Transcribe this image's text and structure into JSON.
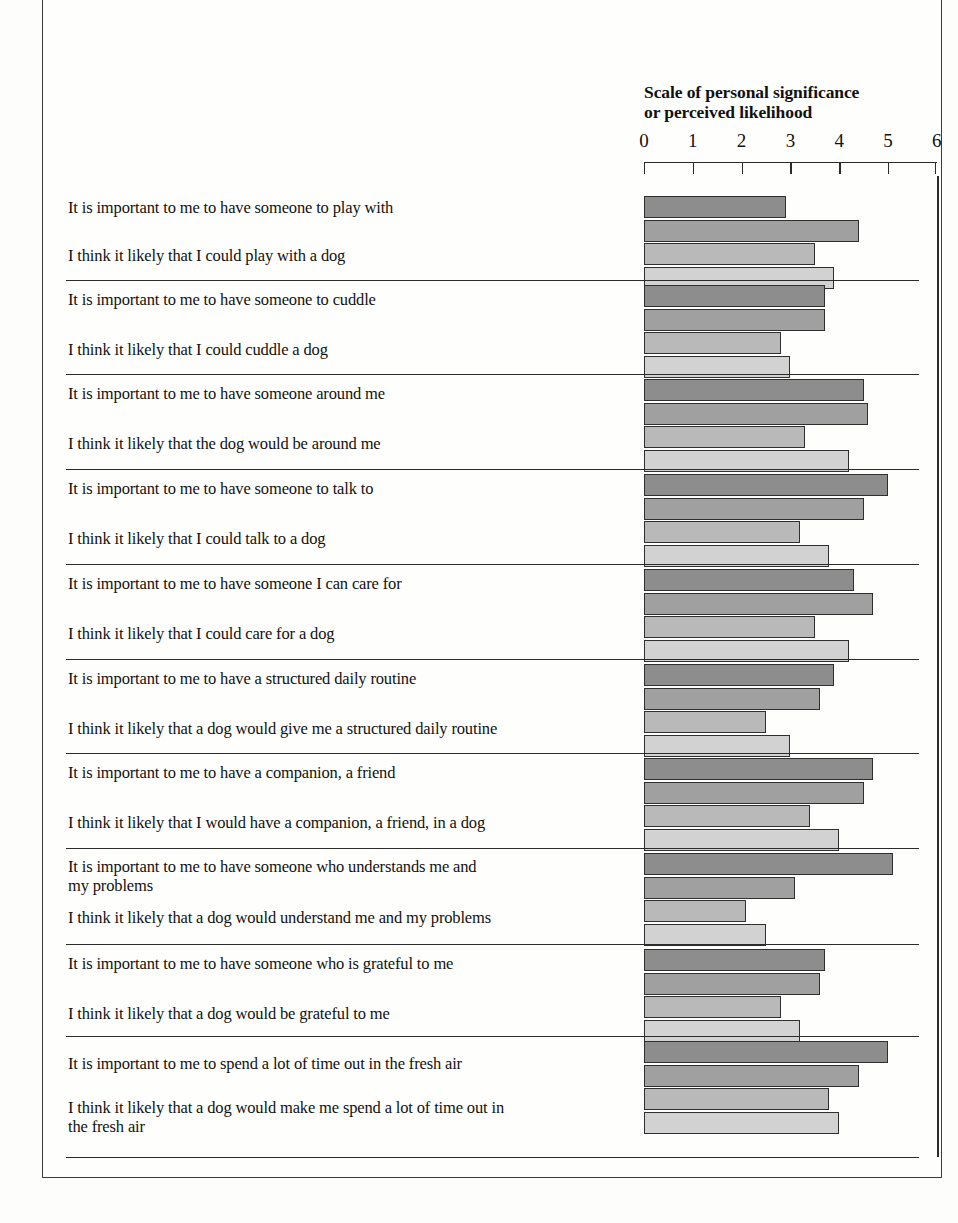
{
  "chart_data": {
    "type": "bar",
    "orientation": "horizontal",
    "title": "Scale of personal significance\nor perceived likelihood",
    "xlabel": "Scale of personal significance or perceived likelihood",
    "ylabel": "",
    "xlim": [
      0,
      6
    ],
    "xticks": [
      0,
      1,
      2,
      3,
      4,
      5,
      6
    ],
    "xtick_labels": [
      "0",
      "1",
      "2",
      "3",
      "4",
      "5",
      "6"
    ],
    "grid": false,
    "legend": "none",
    "bars_per_item": 4,
    "series": [
      {
        "name": "series-1",
        "shade": "#8d8d8d"
      },
      {
        "name": "series-2",
        "shade": "#a0a0a0"
      },
      {
        "name": "series-3",
        "shade": "#b9b9b9"
      },
      {
        "name": "series-4",
        "shade": "#d2d2d2"
      }
    ],
    "groups": [
      {
        "separator": false,
        "items": [
          {
            "label": "It is important to me to have someone to play with",
            "values": [
              2.9
            ]
          },
          {
            "label": "I think it likely that I could play with a dog",
            "values": [
              4.4,
              3.5,
              3.9
            ]
          }
        ]
      },
      {
        "separator": true,
        "items": [
          {
            "label": "It is important to me to have someone to cuddle",
            "values": [
              3.7,
              3.7
            ]
          },
          {
            "label": "I think it likely that I could cuddle a dog",
            "values": [
              2.8,
              3.0
            ]
          }
        ]
      },
      {
        "separator": true,
        "items": [
          {
            "label": "It is important to me to have someone around me",
            "values": [
              4.5,
              4.6
            ]
          },
          {
            "label": "I think it likely that the dog would be around me",
            "values": [
              3.3,
              4.2
            ]
          }
        ]
      },
      {
        "separator": true,
        "items": [
          {
            "label": "It is important to me to have someone to talk to",
            "values": [
              5.0,
              4.5
            ]
          },
          {
            "label": "I think it likely that I could talk to a dog",
            "values": [
              3.2,
              3.8
            ]
          }
        ]
      },
      {
        "separator": true,
        "items": [
          {
            "label": "It is important to me to have someone I can care for",
            "values": [
              4.3,
              4.7
            ]
          },
          {
            "label": "I think it likely that I could care for a dog",
            "values": [
              3.5,
              4.2
            ]
          }
        ]
      },
      {
        "separator": true,
        "items": [
          {
            "label": "It is important to me to have a structured daily routine",
            "values": [
              3.9,
              3.6
            ]
          },
          {
            "label": "I think it likely that a dog would give me a structured daily routine",
            "values": [
              2.5,
              3.0
            ]
          }
        ]
      },
      {
        "separator": true,
        "items": [
          {
            "label": "It is important to me to have a companion, a friend",
            "values": [
              4.7,
              4.5
            ]
          },
          {
            "label": "I think it likely that I would have a companion, a friend, in a dog",
            "values": [
              3.4,
              4.0
            ]
          }
        ]
      },
      {
        "separator": true,
        "items": [
          {
            "label": "It is important to me to have someone who understands me and\nmy problems",
            "values": [
              5.1,
              3.1
            ]
          },
          {
            "label": "I think it likely that a dog would understand me and my problems",
            "values": [
              2.1,
              2.5
            ]
          }
        ]
      },
      {
        "separator": true,
        "items": [
          {
            "label": "It is important to me to have someone who is grateful to me",
            "values": [
              3.7,
              3.6
            ]
          },
          {
            "label": "I think it likely that a dog would be grateful to me",
            "values": [
              2.8,
              3.2
            ]
          }
        ]
      },
      {
        "separator": true,
        "items": [
          {
            "label": "It is important to me to spend a lot of time out in the fresh air",
            "values": [
              5.0,
              4.4
            ]
          },
          {
            "label": "I think it likely that a dog would make me spend a lot of time out in\nthe fresh air",
            "values": [
              3.8,
              4.0
            ]
          }
        ]
      }
    ]
  }
}
